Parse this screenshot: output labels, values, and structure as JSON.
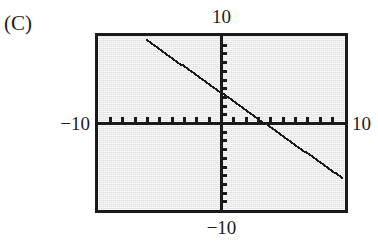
{
  "part": {
    "label": "(C)"
  },
  "labels": {
    "top": "10",
    "bottom": "−10",
    "left": "−10",
    "right": "10"
  },
  "colors": {
    "screen_background": "#e9e9e9",
    "screen_border": "#1a1a1a",
    "axis": "#1a1a1a",
    "curve": "#1a1a1a",
    "page_background": "#ffffff",
    "text": "#1c1c1c"
  },
  "chart_data": {
    "type": "line",
    "title": "",
    "subtitle": "",
    "xlabel": "",
    "ylabel": "",
    "xlim": [
      -10,
      10
    ],
    "ylim": [
      -10,
      10
    ],
    "grid": false,
    "legend": null,
    "axis_ticks": {
      "x_tick_interval": 1,
      "y_tick_interval": 1,
      "x_tick_values": [
        -9,
        -8,
        -7,
        -6,
        -5,
        -4,
        -3,
        -2,
        -1,
        1,
        2,
        3,
        4,
        5,
        6,
        7,
        8,
        9
      ],
      "y_tick_values": [
        -9,
        -8,
        -7,
        -6,
        -5,
        -4,
        -3,
        -2,
        -1,
        1,
        2,
        3,
        4,
        5,
        6,
        7,
        8,
        9
      ],
      "x_tick_labels": [
        "−10",
        "10"
      ],
      "y_tick_labels": [
        "10",
        "−10"
      ]
    },
    "annotations": [],
    "series": [
      {
        "name": "y = -x + 3.5",
        "style": "dotted-line",
        "slope": -1,
        "intercept": 3.5,
        "x_intercept": 3.5,
        "y_intercept": 3.5,
        "x": [
          -6,
          -5,
          -4,
          -3,
          -2,
          -1,
          0,
          1,
          2,
          3,
          4,
          5,
          6,
          7,
          8,
          9,
          9.8
        ],
        "values": [
          9.5,
          8.5,
          7.5,
          6.5,
          5.5,
          4.5,
          3.5,
          2.5,
          1.5,
          0.5,
          -0.5,
          -1.5,
          -2.5,
          -3.5,
          -4.5,
          -5.5,
          -6.3
        ]
      }
    ]
  }
}
